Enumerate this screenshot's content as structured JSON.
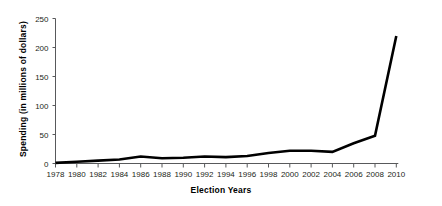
{
  "chart_data": {
    "type": "line",
    "title": "",
    "xlabel": "Election Years",
    "ylabel": "Spending (in millions of dollars)",
    "categories": [
      "1978",
      "1980",
      "1982",
      "1984",
      "1986",
      "1988",
      "1990",
      "1992",
      "1994",
      "1996",
      "1998",
      "2000",
      "2002",
      "2004",
      "2006",
      "2008",
      "2010"
    ],
    "values": [
      1,
      3,
      5,
      7,
      12,
      9,
      10,
      12,
      11,
      13,
      18,
      22,
      22,
      20,
      35,
      48,
      220
    ],
    "x": [
      1978,
      1980,
      1982,
      1984,
      1986,
      1988,
      1990,
      1992,
      1994,
      1996,
      1998,
      2000,
      2002,
      2004,
      2006,
      2008,
      2010
    ],
    "series": [
      {
        "name": "Spending",
        "values": [
          1,
          3,
          5,
          7,
          12,
          9,
          10,
          12,
          11,
          13,
          18,
          22,
          22,
          20,
          35,
          48,
          220
        ]
      }
    ],
    "ylim": [
      0,
      250
    ],
    "yticks": [
      0,
      50,
      100,
      150,
      200,
      250
    ],
    "ytick_labels": [
      "0",
      "50",
      "100",
      "150",
      "200",
      "250"
    ],
    "xlim": [
      1978,
      2010
    ],
    "grid": false,
    "legend": false,
    "legend_position": "none",
    "line_color": "#000000",
    "axis_color": "#58595b",
    "background_color": "#ffffff",
    "markers": false
  }
}
